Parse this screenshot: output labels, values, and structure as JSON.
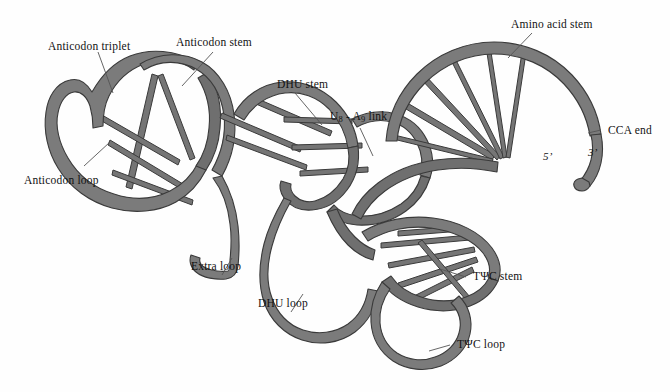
{
  "figure": {
    "background_color": "#fefefe",
    "ribbon_fill": "#7b7b7b",
    "ribbon_stroke": "#3a3a3a",
    "leader_line_color": "#555555",
    "text_color": "#121212"
  },
  "labels": {
    "anticodon_triplet": "Anticodon triplet",
    "anticodon_stem": "Anticodon stem",
    "anticodon_loop": "Anticodon loop",
    "dhu_stem": "DHU stem",
    "dhu_loop": "DHU loop",
    "extra_loop": "Extra loop",
    "u8_a9_link_prefix": "U",
    "u8_a9_link_sub1": "8",
    "u8_a9_link_mid": " - A",
    "u8_a9_link_sub2": "9",
    "u8_a9_link_suffix": " link",
    "amino_acid_stem": "Amino acid stem",
    "cca_end": "CCA end",
    "tpsic_stem": "TΨC stem",
    "tpsic_loop": "TΨC loop",
    "five_prime": "5’",
    "three_prime": "3’"
  }
}
